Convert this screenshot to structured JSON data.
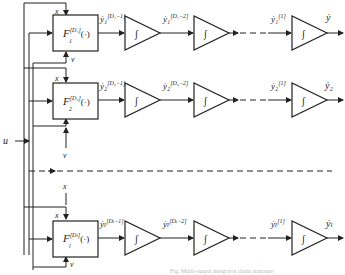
{
  "diagram": {
    "input_label": "u",
    "state_label": "x",
    "noise_label": "v",
    "caption": "Fig. Multi-output integrator chain structure",
    "rows": [
      {
        "id": "1",
        "block_label": "F",
        "block_sub": "1",
        "block_sup": "[D₁]",
        "block_arg": "(·)",
        "sig1": "ẏ₁",
        "sig1_sup": "[D₁−1]",
        "sig2": "ẏ₁",
        "sig2_sup": "[D₁−2]",
        "sig3": "ẏ₁",
        "sig3_sup": "[1]",
        "output": "ẏ"
      },
      {
        "id": "2",
        "block_label": "F",
        "block_sub": "2",
        "block_sup": "[D₂]",
        "block_arg": "(·)",
        "sig1": "ẏ₂",
        "sig1_sup": "[D₂−1]",
        "sig2": "ẏ₂",
        "sig2_sup": "[D₂−2]",
        "sig3": "ẏ₂",
        "sig3_sup": "[1]",
        "output": "ẏ₂"
      },
      {
        "id": "l",
        "block_label": "F",
        "block_sub": "l",
        "block_sup": "[Dₗ]",
        "block_arg": "(·)",
        "sig1": "ẏₗ",
        "sig1_sup": "[Dₗ−1]",
        "sig2": "ẏₗ",
        "sig2_sup": "[Dₗ−2]",
        "sig3": "ẏₗ",
        "sig3_sup": "[1]",
        "output": "ẏₗ"
      }
    ],
    "integrator_symbol": "∫"
  }
}
